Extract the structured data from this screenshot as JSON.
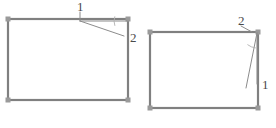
{
  "page": {
    "background_color": "#ffffff",
    "width": 276,
    "height": 128
  },
  "style": {
    "rect_stroke_color": "#808080",
    "rect_stroke_width": 2.2,
    "corner_marker_color": "#9a9a9a",
    "corner_marker_size": 5,
    "leader_stroke_color": "#8c8c8c",
    "leader_stroke_width": 1,
    "arc_stroke_color": "#b0b0b0",
    "arc_stroke_width": 0.9,
    "label_color": "#4a4a4a",
    "label_font_size": 13
  },
  "figures": [
    {
      "id": "figure-left",
      "name": "left-figure",
      "rect": {
        "x": 8,
        "y": 19,
        "width": 120,
        "height": 81
      },
      "corners": [
        {
          "name": "top-left",
          "x": 8,
          "y": 19
        },
        {
          "name": "top-right",
          "x": 128,
          "y": 19
        },
        {
          "name": "bottom-left",
          "x": 8,
          "y": 100
        },
        {
          "name": "bottom-right",
          "x": 128,
          "y": 100
        }
      ],
      "vertex": {
        "x": 80,
        "y": 21
      },
      "leaders": [
        {
          "name": "leader-to-corner",
          "x1": 80,
          "y1": 21,
          "x2": 127,
          "y2": 21
        },
        {
          "name": "leader-to-point-2",
          "x1": 80,
          "y1": 21,
          "x2": 124,
          "y2": 36
        }
      ],
      "tick": {
        "name": "vertex-tick",
        "x1": 80,
        "y1": 12,
        "x2": 80,
        "y2": 21
      },
      "arc": {
        "name": "angle-arc",
        "cx": 127,
        "cy": 21,
        "r": 13,
        "start_deg": 160,
        "end_deg": 199
      },
      "labels": [
        {
          "name": "label-1",
          "text": "1",
          "x": 77,
          "y": 8
        },
        {
          "name": "label-2",
          "text": "2",
          "x": 130,
          "y": 39
        }
      ]
    },
    {
      "id": "figure-right",
      "name": "right-figure",
      "rect": {
        "x": 150,
        "y": 32,
        "width": 108,
        "height": 76
      },
      "corners": [
        {
          "name": "top-left",
          "x": 150,
          "y": 32
        },
        {
          "name": "top-right",
          "x": 258,
          "y": 32
        },
        {
          "name": "bottom-left",
          "x": 150,
          "y": 108
        },
        {
          "name": "bottom-right",
          "x": 258,
          "y": 108
        }
      ],
      "vertex": {
        "x": 258,
        "y": 33
      },
      "leaders": [
        {
          "name": "leader-to-point-1",
          "x1": 257,
          "y1": 33,
          "x2": 246,
          "y2": 88
        },
        {
          "name": "leader-to-edge",
          "x1": 257,
          "y1": 33,
          "x2": 257,
          "y2": 84
        }
      ],
      "tick": {
        "name": "vertex-tick",
        "x1": 241,
        "y1": 26,
        "x2": 252,
        "y2": 32
      },
      "arc": {
        "name": "angle-arc",
        "cx": 257,
        "cy": 33,
        "r": 15,
        "start_deg": 96,
        "end_deg": 128
      },
      "labels": [
        {
          "name": "label-2",
          "text": "2",
          "x": 238,
          "y": 22
        },
        {
          "name": "label-1",
          "text": "1",
          "x": 262,
          "y": 86
        }
      ]
    }
  ]
}
